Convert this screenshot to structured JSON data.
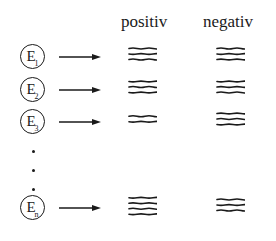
{
  "headers": {
    "positive": "positiv",
    "negative": "negativ"
  },
  "rows": [
    {
      "label": "E",
      "subscript": "1",
      "positive_bands": 3,
      "negative_bands": 3
    },
    {
      "label": "E",
      "subscript": "2",
      "positive_bands": 3,
      "negative_bands": 3
    },
    {
      "label": "E",
      "subscript": "3",
      "positive_bands": 2,
      "negative_bands": 3
    },
    {
      "label": "E",
      "subscript": "n",
      "positive_bands": 4,
      "negative_bands": 3
    }
  ],
  "ellipsis_dots": 3,
  "colors": {
    "ink": "#1a1a1a",
    "background": "#ffffff"
  }
}
